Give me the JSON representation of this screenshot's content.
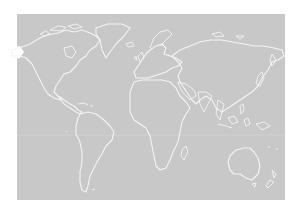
{
  "map": {
    "title": "",
    "projection": "world outline",
    "colors": {
      "ocean_land": "#c8c8c8",
      "coastline": "#f4f4f4",
      "background": "#ffffff"
    },
    "regions": [
      "north-america",
      "greenland",
      "south-america",
      "europe",
      "africa",
      "asia",
      "australia",
      "new-zealand",
      "madagascar",
      "japan",
      "indonesia"
    ]
  }
}
